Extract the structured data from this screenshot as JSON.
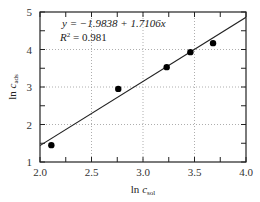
{
  "chart_data": {
    "type": "scatter",
    "title": "",
    "xlabel": "ln c_sol",
    "ylabel": "ln c_ads",
    "xlabel_main": "ln ",
    "xlabel_var": "c",
    "xlabel_sub": "sol",
    "ylabel_main": "ln ",
    "ylabel_var": "c",
    "ylabel_sub": "ads",
    "xlim": [
      2.0,
      4.0
    ],
    "ylim": [
      1,
      5
    ],
    "x_ticks": [
      2.0,
      2.5,
      3.0,
      3.5,
      4.0
    ],
    "x_tick_labels": [
      "2.0",
      "2.5",
      "3.0",
      "3.5",
      "4.0"
    ],
    "y_ticks": [
      1,
      2,
      3,
      4,
      5
    ],
    "y_tick_labels": [
      "1",
      "2",
      "3",
      "4",
      "5"
    ],
    "grid": "dotted at major ticks",
    "series": [
      {
        "name": "data",
        "type": "scatter",
        "x": [
          2.11,
          2.76,
          3.23,
          3.46,
          3.68
        ],
        "y": [
          1.45,
          2.95,
          3.53,
          3.93,
          4.17
        ]
      },
      {
        "name": "fit",
        "type": "line",
        "intercept": -1.9838,
        "slope": 1.7106,
        "x": [
          2.0,
          4.0
        ],
        "y": [
          1.4374,
          4.8586
        ]
      }
    ],
    "annotations": [
      "y = −1.9838 + 1.7106x",
      "R² = 0.981"
    ],
    "legend": "none"
  },
  "annotation": {
    "equation": "y = −1.9838 + 1.7106x",
    "r2_label": "R",
    "r2_sup": "2",
    "r2_value": " = 0.981"
  },
  "colors": {
    "frame": "#222222",
    "grid": "#999999",
    "points": "#000000",
    "line": "#222222"
  }
}
